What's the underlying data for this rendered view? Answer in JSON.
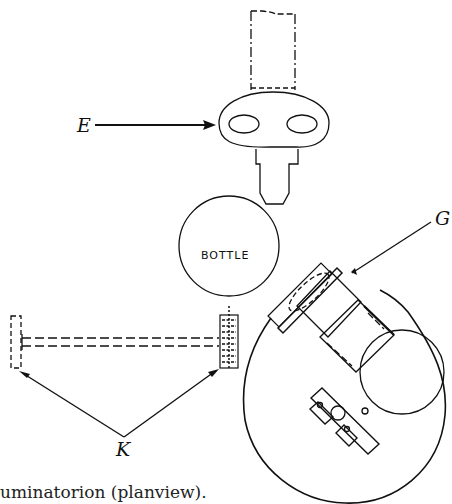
{
  "diagram": {
    "labels": {
      "E": "E",
      "G": "G",
      "K": "K",
      "bottle": "BOTTLE"
    },
    "caption": "uminatorion (planview).",
    "colors": {
      "stroke": "#111111",
      "background": "#ffffff"
    }
  }
}
